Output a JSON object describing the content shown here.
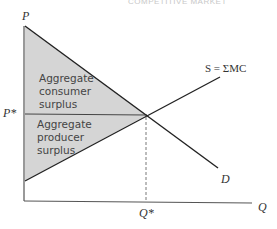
{
  "page_header": "COMPETITIVE MARKET",
  "diagram": {
    "axes": {
      "y_label": "P",
      "x_label": "Q"
    },
    "equilibrium": {
      "price_label": "P*",
      "quantity_label": "Q*"
    },
    "curves": {
      "supply_label": "S = ΣMC",
      "demand_label": "D"
    },
    "regions": {
      "consumer_surplus": [
        "Aggregate",
        "consumer",
        "surplus"
      ],
      "producer_surplus": [
        "Aggregate",
        "producer",
        "surplus"
      ]
    },
    "colors": {
      "shading": "#d5d5d5",
      "lines": "#222222",
      "axis": "#555555"
    }
  }
}
